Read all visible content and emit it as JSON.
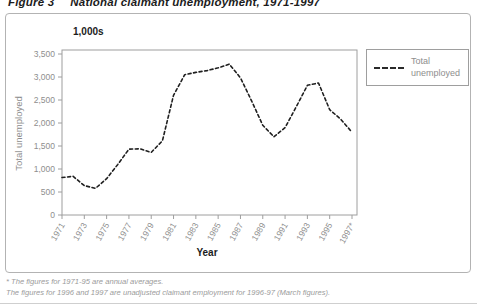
{
  "figure": {
    "label": "Figure 3",
    "title": "National claimant unemployment, 1971-1997"
  },
  "chart_data": {
    "type": "line",
    "units_label": "1,000s",
    "xlabel": "Year",
    "ylabel": "Total unemployed",
    "ylim": [
      0,
      3500
    ],
    "ytick_step": 500,
    "yticks": [
      "0",
      "500",
      "1,000",
      "1,500",
      "2,000",
      "2,500",
      "3,000",
      "3,500"
    ],
    "xticks": [
      "1971",
      "1973",
      "1975",
      "1977",
      "1979",
      "1981",
      "1983",
      "1985",
      "1987",
      "1989",
      "1991",
      "1993",
      "1995",
      "1997*"
    ],
    "x": [
      1971,
      1972,
      1973,
      1974,
      1975,
      1976,
      1977,
      1978,
      1979,
      1980,
      1981,
      1982,
      1983,
      1984,
      1985,
      1986,
      1987,
      1988,
      1989,
      1990,
      1991,
      1992,
      1993,
      1994,
      1995,
      1996,
      1997
    ],
    "series": [
      {
        "name": "Total unemployed",
        "line_style": "dashed",
        "color": "#1f1f1f",
        "values": [
          815,
          840,
          640,
          580,
          790,
          1100,
          1430,
          1440,
          1360,
          1610,
          2600,
          3050,
          3100,
          3140,
          3200,
          3280,
          2980,
          2480,
          1950,
          1700,
          1900,
          2350,
          2820,
          2870,
          2290,
          2080,
          1800
        ]
      }
    ],
    "legend_position": "top-right",
    "grid": false
  },
  "footnotes": [
    "* The figures for 1971-95 are annual averages.",
    "The figures for 1996 and 1997 are unadjusted claimant employment for 1996-97 (March figures)."
  ],
  "colors": {
    "line": "#1f1f1f",
    "axis": "#9e9e9e",
    "tick_text": "#8e8e8e",
    "title_text": "#1c1c1c",
    "footnote_text": "#9b9b9b",
    "frame_border": "#b3b3b3"
  }
}
